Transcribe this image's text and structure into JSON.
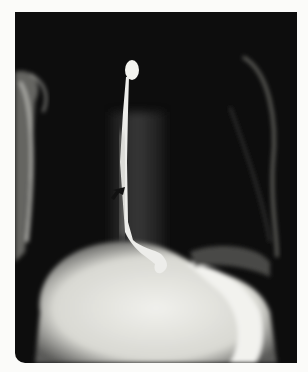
{
  "image": {
    "type": "radiograph",
    "description": "Barium swallow X-ray showing contrast-filled esophagus descending into stomach",
    "colors": {
      "background": "#fbfbf9",
      "film": "#0d0d0d",
      "contrast": "#f2f2ee"
    },
    "annotations": [
      {
        "kind": "arrow",
        "position": [
          115,
          188
        ]
      }
    ]
  }
}
